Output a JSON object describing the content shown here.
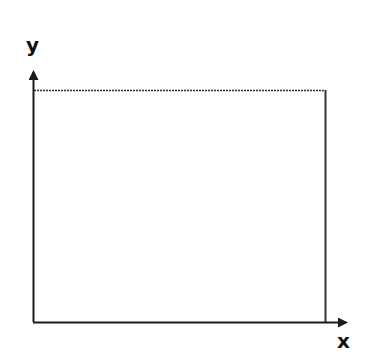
{
  "diagram": {
    "type": "axes-with-rectangle",
    "x_axis_label": "x",
    "y_axis_label": "y",
    "colors": {
      "axis": "#1a1a1a",
      "rect_top": "#333333",
      "rect_right": "#333333",
      "background": "#ffffff"
    }
  }
}
